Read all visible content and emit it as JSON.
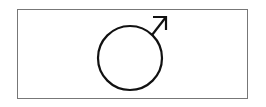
{
  "symbol": {
    "name": "male-symbol",
    "stroke_color": "#111111",
    "frame_color": "#777777"
  }
}
